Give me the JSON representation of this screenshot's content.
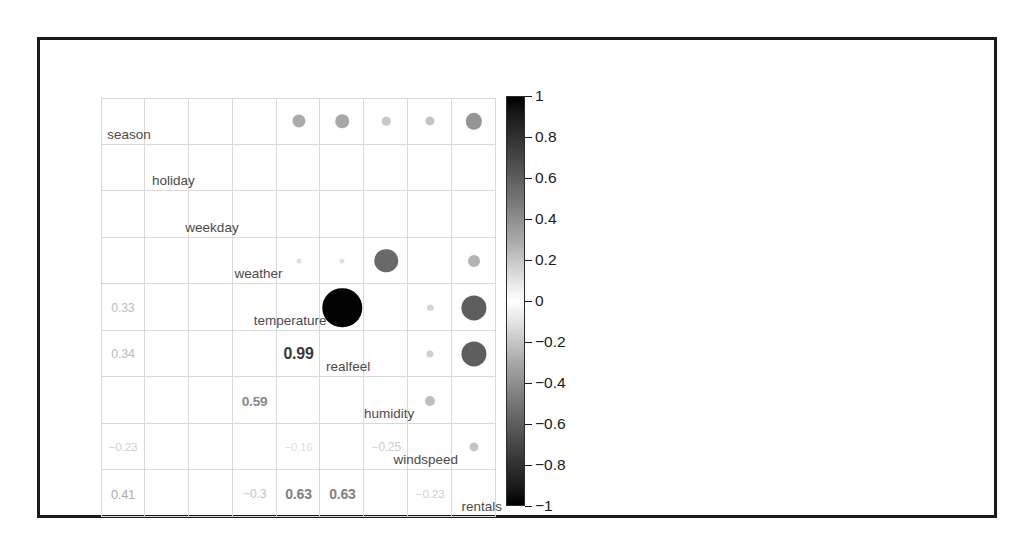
{
  "figure": {
    "type": "correlogram",
    "frame_color": "#1a1a1a",
    "grid_line_color": "#d9d9d9"
  },
  "chart_data": {
    "type": "heatmap",
    "subtype": "correlation-matrix-corrplot-mixed",
    "title": "",
    "subtitle": "",
    "xlabel": "",
    "ylabel": "",
    "variables": [
      "season",
      "holiday",
      "weekday",
      "weather",
      "temperature",
      "realfeel",
      "humidity",
      "windspeed",
      "rentals"
    ],
    "upper_triangle_encoding": "filled circles, area and darkness proportional to |r|",
    "lower_triangle_encoding": "numeric correlation coefficients, opacity proportional to |r|",
    "diagonal_encoding": "variable name label",
    "color_scale": {
      "name": "grayscale-diverging",
      "min": -1,
      "max": 1,
      "color_at_plus_one": "#000000",
      "color_at_zero": "#ffffff",
      "color_at_minus_one": "#000000",
      "tick_labels": [
        "1",
        "0.8",
        "0.6",
        "0.4",
        "0.2",
        "0",
        "−0.2",
        "−0.4",
        "−0.6",
        "−0.8",
        "−1"
      ],
      "tick_values": [
        1,
        0.8,
        0.6,
        0.4,
        0.2,
        0,
        -0.2,
        -0.4,
        -0.6,
        -0.8,
        -1
      ],
      "legend_position": "right"
    },
    "matrix": [
      [
        1.0,
        0.0,
        0.0,
        0.02,
        0.33,
        0.34,
        0.21,
        -0.23,
        0.41
      ],
      [
        0.0,
        1.0,
        0.0,
        0.0,
        0.0,
        0.0,
        0.0,
        0.0,
        0.0
      ],
      [
        0.0,
        0.0,
        1.0,
        0.0,
        0.0,
        0.0,
        0.0,
        0.0,
        0.0
      ],
      [
        0.02,
        0.0,
        0.0,
        1.0,
        -0.12,
        -0.12,
        0.59,
        0.04,
        -0.3
      ],
      [
        0.33,
        0.0,
        0.0,
        -0.12,
        1.0,
        0.99,
        0.13,
        -0.16,
        0.63
      ],
      [
        0.34,
        0.0,
        0.0,
        -0.12,
        0.99,
        1.0,
        0.14,
        -0.18,
        0.63
      ],
      [
        0.21,
        0.0,
        0.0,
        0.59,
        0.13,
        0.14,
        1.0,
        -0.25,
        -0.1
      ],
      [
        -0.23,
        0.0,
        0.0,
        0.04,
        -0.16,
        -0.18,
        -0.25,
        1.0,
        -0.23
      ],
      [
        0.41,
        0.0,
        0.0,
        -0.3,
        0.63,
        0.63,
        -0.1,
        -0.23,
        1.0
      ]
    ],
    "labeled_lower_cells": [
      {
        "row": "temperature",
        "col": "season",
        "text": "0.33",
        "value": 0.33
      },
      {
        "row": "realfeel",
        "col": "season",
        "text": "0.34",
        "value": 0.34
      },
      {
        "row": "humidity",
        "col": "weather",
        "text": "0.59",
        "value": 0.59
      },
      {
        "row": "realfeel",
        "col": "temperature",
        "text": "0.99",
        "value": 0.99
      },
      {
        "row": "windspeed",
        "col": "season",
        "text": "−0.23",
        "value": -0.23
      },
      {
        "row": "windspeed",
        "col": "temperature",
        "text": "−0.16",
        "value": -0.16
      },
      {
        "row": "windspeed",
        "col": "humidity",
        "text": "−0.25",
        "value": -0.25
      },
      {
        "row": "rentals",
        "col": "season",
        "text": "0.41",
        "value": 0.41
      },
      {
        "row": "rentals",
        "col": "weather",
        "text": "−0.3",
        "value": -0.3
      },
      {
        "row": "rentals",
        "col": "temperature",
        "text": "0.63",
        "value": 0.63
      },
      {
        "row": "rentals",
        "col": "realfeel",
        "text": "0.63",
        "value": 0.63
      },
      {
        "row": "rentals",
        "col": "windspeed",
        "text": "−0.23",
        "value": -0.23
      }
    ],
    "visible_upper_circles": [
      {
        "row": "season",
        "col": "temperature",
        "value": 0.33
      },
      {
        "row": "season",
        "col": "realfeel",
        "value": 0.34
      },
      {
        "row": "season",
        "col": "humidity",
        "value": 0.21
      },
      {
        "row": "season",
        "col": "windspeed",
        "value": -0.23
      },
      {
        "row": "season",
        "col": "rentals",
        "value": 0.41
      },
      {
        "row": "weather",
        "col": "temperature",
        "value": -0.12
      },
      {
        "row": "weather",
        "col": "realfeel",
        "value": -0.12
      },
      {
        "row": "weather",
        "col": "humidity",
        "value": 0.59
      },
      {
        "row": "weather",
        "col": "rentals",
        "value": -0.3
      },
      {
        "row": "temperature",
        "col": "realfeel",
        "value": 0.99
      },
      {
        "row": "temperature",
        "col": "windspeed",
        "value": -0.16
      },
      {
        "row": "temperature",
        "col": "rentals",
        "value": 0.63
      },
      {
        "row": "realfeel",
        "col": "windspeed",
        "value": -0.18
      },
      {
        "row": "realfeel",
        "col": "rentals",
        "value": 0.63
      },
      {
        "row": "humidity",
        "col": "windspeed",
        "value": -0.25
      },
      {
        "row": "windspeed",
        "col": "rentals",
        "value": -0.23
      }
    ]
  }
}
